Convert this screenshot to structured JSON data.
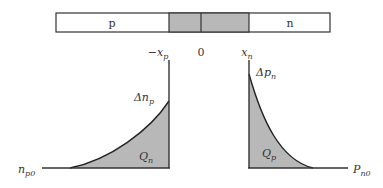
{
  "bar": {
    "p_label": "p",
    "n_label": "n",
    "colors": {
      "fill": "#ffffff",
      "depletion": "#b8b8b8",
      "stroke": "#333333"
    }
  },
  "axis_labels": {
    "minus_xp": {
      "prefix": "−x",
      "sub": "p"
    },
    "zero": "0",
    "xn": {
      "prefix": "x",
      "sub": "n"
    }
  },
  "left_plot": {
    "peak_label": {
      "prefix": "Δn",
      "sub": "p"
    },
    "area_label": {
      "prefix": "Q",
      "sub": "n"
    },
    "baseline_label": {
      "prefix": "n",
      "sub": "p0"
    }
  },
  "right_plot": {
    "peak_label": {
      "prefix": "Δp",
      "sub": "n"
    },
    "area_label": {
      "prefix": "Q",
      "sub": "p"
    },
    "baseline_label": {
      "prefix": "P",
      "sub": "n0"
    }
  },
  "colors": {
    "shade": "#b8b8b8",
    "line": "#333333"
  }
}
